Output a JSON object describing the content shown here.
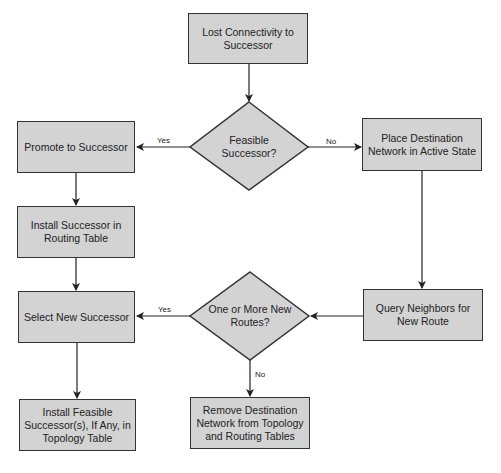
{
  "colors": {
    "fill": "#d3d3d3",
    "stroke": "#333333",
    "background": "#ffffff"
  },
  "nodes": {
    "lost": {
      "type": "process",
      "text": "Lost Connectivity to Successor"
    },
    "feasible": {
      "type": "decision",
      "text": "Feasible Successor?"
    },
    "promote": {
      "type": "process",
      "text": "Promote to Successor"
    },
    "place": {
      "type": "process",
      "text": "Place Destination Network in Active State"
    },
    "install_succ": {
      "type": "process",
      "text": "Install Successor in Routing Table"
    },
    "query": {
      "type": "process",
      "text": "Query Neighbors for New Route"
    },
    "routes": {
      "type": "decision",
      "text": "One or More New Routes?"
    },
    "select": {
      "type": "process",
      "text": "Select New Successor"
    },
    "install_feas": {
      "type": "process",
      "text": "Install Feasible Successor(s), If Any, in Topology Table"
    },
    "remove": {
      "type": "process",
      "text": "Remove Destination Network from Topology and Routing Tables"
    }
  },
  "edges": {
    "feasible_yes": "Yes",
    "feasible_no": "No",
    "routes_yes": "Yes",
    "routes_no": "No"
  }
}
